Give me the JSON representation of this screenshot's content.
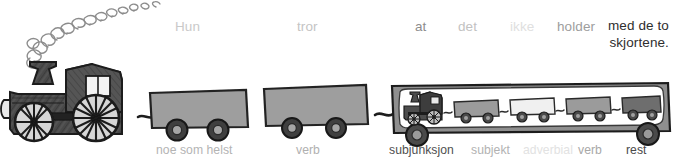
{
  "figure": {
    "type": "hand-drawn-train-sentence-diagram",
    "language": "Norwegian",
    "full_sentence": "Hun tror at det ikke holder med de to skjortene.",
    "background_color": "#ffffff"
  },
  "sentence_words": [
    {
      "text": "Hun",
      "color": "#c9c9c9",
      "x": 175,
      "y": 19,
      "weight": "400"
    },
    {
      "text": "tror",
      "color": "#c4c4c4",
      "x": 297,
      "y": 19,
      "weight": "400"
    },
    {
      "text": "at",
      "color": "#8d8d8d",
      "x": 415,
      "y": 19,
      "weight": "400"
    },
    {
      "text": "det",
      "color": "#c2c2c2",
      "x": 458,
      "y": 19,
      "weight": "400"
    },
    {
      "text": "ikke",
      "color": "#e0e0e0",
      "x": 510,
      "y": 19,
      "weight": "400"
    },
    {
      "text": "holder",
      "color": "#9d9d9d",
      "x": 557,
      "y": 19,
      "weight": "400"
    }
  ],
  "final_phrase": {
    "line1": "med de to",
    "line2": "skjortene.",
    "color": "#2e2e2e",
    "x": 608,
    "y": 18,
    "align": "right"
  },
  "function_labels": [
    {
      "text": "noe som helst",
      "color": "#b4b4b4",
      "x": 156,
      "y": 143
    },
    {
      "text": "verb",
      "color": "#b0b0b0",
      "x": 296,
      "y": 143
    },
    {
      "text": "subjunksjon",
      "color": "#4f4f4f",
      "x": 389,
      "y": 143
    },
    {
      "text": "subjekt",
      "color": "#b2b2b2",
      "x": 471,
      "y": 143
    },
    {
      "text": "adverbial",
      "color": "#e2e2e2",
      "x": 523,
      "y": 143
    },
    {
      "text": "verb",
      "color": "#a8a8a8",
      "x": 578,
      "y": 143
    },
    {
      "text": "rest",
      "color": "#4a4a4a",
      "x": 626,
      "y": 143
    }
  ],
  "colors": {
    "pencil_dark": "#3a3a3a",
    "pencil_mid": "#5d5d5d",
    "wagon_fill": "#9e9e9e",
    "wagon_stroke": "#2b2b2b",
    "flatbed_fill": "#8f8f8f",
    "flatbed_inner": "#ffffff",
    "mini_wagon_light": "#f0f0f0",
    "mini_wagon_gray": "#9b9b9b",
    "mini_wagon_dark": "#6e6e6e",
    "wheel_dark": "#3d3d3d",
    "wheel_inner": "#8a8a8a",
    "smoke": "#8a8a8a"
  },
  "drawing_parts": {
    "locomotive": "steam-locomotive-pencil-sketch",
    "smoke": "rising-smoke-spiral-puffs",
    "wagon_1": "gray-boxcar",
    "wagon_2": "gray-boxcar",
    "flatbed": "long-flatcar-containing-miniature-train",
    "mini_train": "miniature-locomotive-with-four-wagons"
  }
}
